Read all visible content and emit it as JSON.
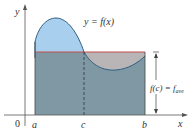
{
  "diagram": {
    "curve_label": "y = f(x)",
    "avg_label_main": "f(c) = f",
    "avg_label_sub": "ave",
    "axis_labels": {
      "x": "x",
      "y": "y",
      "origin": "0"
    },
    "tick_labels": {
      "a": "a",
      "c": "c",
      "b": "b"
    },
    "colors": {
      "above_avg_fill": "#a9cfee",
      "below_avg_rect_fill": "#7f98a4",
      "dip_fill": "#b9b4b6",
      "avg_line": "#c0504d",
      "curve": "#2f5f80",
      "axis": "#555555"
    }
  }
}
